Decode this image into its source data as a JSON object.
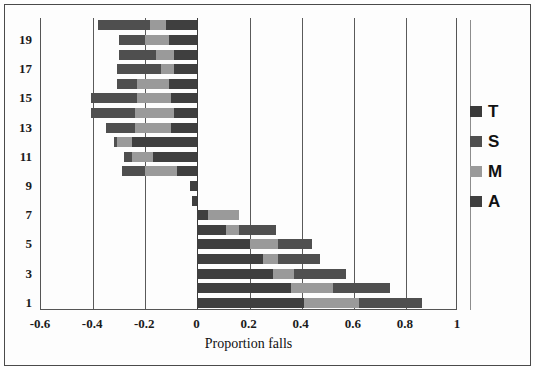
{
  "chart_data": {
    "type": "bar",
    "orientation": "horizontal",
    "stacked": true,
    "diverging": true,
    "title": "",
    "xlabel": "Proportion falls",
    "ylabel": "",
    "xlim": [
      -0.6,
      1.0
    ],
    "xticks": [
      "-0.6",
      "-0.4",
      "-0.2",
      "0",
      "0.2",
      "0.4",
      "0.6",
      "0.8",
      "1"
    ],
    "xtick_values": [
      -0.6,
      -0.4,
      -0.2,
      0,
      0.2,
      0.4,
      0.6,
      0.8,
      1
    ],
    "ytick_labels": [
      "1",
      "3",
      "5",
      "7",
      "9",
      "11",
      "13",
      "15",
      "17",
      "19"
    ],
    "categories": [
      1,
      2,
      3,
      4,
      5,
      6,
      7,
      8,
      9,
      10,
      11,
      12,
      13,
      14,
      15,
      16,
      17,
      18,
      19,
      20
    ],
    "grid": "vertical",
    "legend_position": "right",
    "legend": [
      {
        "name": "T",
        "color": "#3a3a3a"
      },
      {
        "name": "S",
        "color": "#4f4f4f"
      },
      {
        "name": "M",
        "color": "#9a9a9a"
      },
      {
        "name": "A",
        "color": "#3f3f3f"
      }
    ],
    "series": [
      {
        "name": "A",
        "color": "#3f3f3f",
        "values": [
          0.41,
          0.36,
          0.29,
          0.25,
          0.2,
          0.11,
          0.04,
          -0.02,
          -0.03,
          -0.08,
          -0.17,
          -0.25,
          -0.1,
          -0.09,
          -0.1,
          -0.11,
          -0.09,
          -0.09,
          -0.11,
          -0.12
        ]
      },
      {
        "name": "M",
        "color": "#9a9a9a",
        "values": [
          0.21,
          0.16,
          0.08,
          0.06,
          0.11,
          0.05,
          0.12,
          0.0,
          0.0,
          -0.12,
          -0.08,
          -0.06,
          -0.14,
          -0.15,
          -0.13,
          -0.12,
          -0.05,
          -0.07,
          -0.09,
          -0.06
        ]
      },
      {
        "name": "S",
        "color": "#4f4f4f",
        "values": [
          0.24,
          0.22,
          0.2,
          0.16,
          0.13,
          0.14,
          0.0,
          0.0,
          0.0,
          -0.09,
          -0.03,
          -0.01,
          -0.11,
          -0.17,
          -0.18,
          -0.08,
          -0.17,
          -0.14,
          -0.1,
          -0.2
        ]
      },
      {
        "name": "T",
        "color": "#3a3a3a",
        "values": [
          0.0,
          0.0,
          0.0,
          0.0,
          0.0,
          0.0,
          0.0,
          0.0,
          0.0,
          0.0,
          0.0,
          0.0,
          0.0,
          0.0,
          0.0,
          0.0,
          0.0,
          0.0,
          0.0,
          0.0
        ]
      }
    ],
    "bar_totals": [
      0.86,
      0.74,
      0.57,
      0.47,
      0.44,
      0.3,
      0.16,
      -0.02,
      -0.03,
      -0.29,
      -0.28,
      -0.32,
      -0.35,
      -0.41,
      -0.41,
      -0.31,
      -0.31,
      -0.3,
      -0.3,
      -0.38
    ]
  },
  "axis": {
    "x_title": "Proportion falls"
  }
}
